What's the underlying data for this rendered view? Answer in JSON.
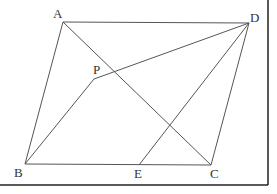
{
  "diagram": {
    "type": "geometry",
    "points": {
      "A": {
        "label": "A",
        "x": 63,
        "y": 22,
        "lx": 53,
        "ly": 18
      },
      "D": {
        "label": "D",
        "x": 249,
        "y": 23,
        "lx": 250,
        "ly": 22
      },
      "B": {
        "label": "B",
        "x": 25,
        "y": 164,
        "lx": 14,
        "ly": 177
      },
      "C": {
        "label": "C",
        "x": 211,
        "y": 165,
        "lx": 210,
        "ly": 178
      },
      "P": {
        "label": "P",
        "x": 94,
        "y": 79,
        "lx": 93,
        "ly": 74
      },
      "E": {
        "label": "E",
        "x": 139,
        "y": 165,
        "lx": 134,
        "ly": 178
      }
    },
    "segments": [
      [
        "A",
        "D"
      ],
      [
        "A",
        "B"
      ],
      [
        "D",
        "C"
      ],
      [
        "B",
        "C"
      ],
      [
        "A",
        "C"
      ],
      [
        "P",
        "D"
      ],
      [
        "P",
        "B"
      ],
      [
        "D",
        "E"
      ]
    ],
    "frame": {
      "right_x": 268,
      "bottom_y": 185
    },
    "colors": {
      "line": "#555555",
      "frame": "#222222",
      "label": "#333333"
    }
  }
}
